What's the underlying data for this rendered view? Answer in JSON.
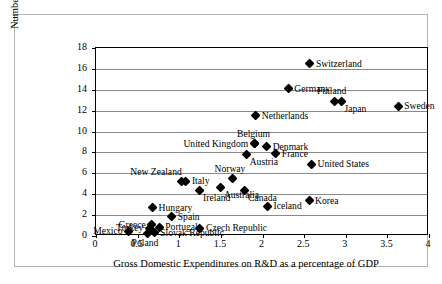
{
  "chart_data": {
    "type": "scatter",
    "title": "",
    "xlabel": "Gross Domestic Expenditures on R&D as a percentage of GDP",
    "ylabel": "Number of triadic patents per million of dollars invested in R&D",
    "xlim": [
      0,
      4
    ],
    "ylim": [
      0,
      18
    ],
    "xticks": [
      "0",
      "0.5",
      "1",
      "1.5",
      "2",
      "2.5",
      "3",
      "3.5",
      "4"
    ],
    "xtick_values": [
      0,
      0.5,
      1,
      1.5,
      2,
      2.5,
      3,
      3.5,
      4
    ],
    "yticks": [
      "0",
      "2",
      "4",
      "6",
      "8",
      "10",
      "12",
      "14",
      "16",
      "18"
    ],
    "ytick_values": [
      0,
      2,
      4,
      6,
      8,
      10,
      12,
      14,
      16,
      18
    ],
    "grid": "horizontal",
    "legend": "none",
    "marker_shape": "diamond",
    "marker_color": "#000000",
    "points": [
      {
        "name": "Switzerland",
        "x": 2.57,
        "y": 16.5,
        "label_pos": "right"
      },
      {
        "name": "Germany",
        "x": 2.31,
        "y": 14.1,
        "label_pos": "right"
      },
      {
        "name": "Finland",
        "x": 2.87,
        "y": 12.9,
        "label_pos": "above"
      },
      {
        "name": "Japan",
        "x": 2.95,
        "y": 12.85,
        "label_pos": "below-right"
      },
      {
        "name": "Sweden",
        "x": 3.63,
        "y": 12.4,
        "label_pos": "right"
      },
      {
        "name": "Netherlands",
        "x": 1.92,
        "y": 11.5,
        "label_pos": "right"
      },
      {
        "name": "Belgium",
        "x": 1.91,
        "y": 8.8,
        "label_pos": "above"
      },
      {
        "name": "United Kingdom",
        "x": 1.9,
        "y": 8.8,
        "label_pos": "left"
      },
      {
        "name": "Denmark",
        "x": 2.05,
        "y": 8.55,
        "label_pos": "right"
      },
      {
        "name": "Austria",
        "x": 1.81,
        "y": 7.75,
        "label_pos": "below-right"
      },
      {
        "name": "France",
        "x": 2.16,
        "y": 7.85,
        "label_pos": "right"
      },
      {
        "name": "United States",
        "x": 2.59,
        "y": 6.85,
        "label_pos": "right"
      },
      {
        "name": "Norway",
        "x": 1.64,
        "y": 5.5,
        "label_pos": "above"
      },
      {
        "name": "New Zealand",
        "x": 1.03,
        "y": 5.2,
        "label_pos": "above-left"
      },
      {
        "name": "Italy",
        "x": 1.08,
        "y": 5.25,
        "label_pos": "right"
      },
      {
        "name": "Australia",
        "x": 1.5,
        "y": 4.6,
        "label_pos": "below-right"
      },
      {
        "name": "Ireland",
        "x": 1.25,
        "y": 4.3,
        "label_pos": "below-right"
      },
      {
        "name": "Canada",
        "x": 1.79,
        "y": 4.3,
        "label_pos": "below-right"
      },
      {
        "name": "Korea",
        "x": 2.56,
        "y": 3.35,
        "label_pos": "right"
      },
      {
        "name": "Iceland",
        "x": 2.06,
        "y": 2.85,
        "label_pos": "right"
      },
      {
        "name": "Hungary",
        "x": 0.68,
        "y": 2.7,
        "label_pos": "right"
      },
      {
        "name": "Spain",
        "x": 0.91,
        "y": 1.85,
        "label_pos": "right"
      },
      {
        "name": "Greece",
        "x": 0.67,
        "y": 1.1,
        "label_pos": "left"
      },
      {
        "name": "Portugal",
        "x": 0.76,
        "y": 0.85,
        "label_pos": "right"
      },
      {
        "name": "Turkey",
        "x": 0.64,
        "y": 0.75,
        "label_pos": "left"
      },
      {
        "name": "Czech Republic",
        "x": 1.25,
        "y": 0.75,
        "label_pos": "right"
      },
      {
        "name": "Slovak Republic",
        "x": 0.7,
        "y": 0.3,
        "label_pos": "right"
      },
      {
        "name": "Poland",
        "x": 0.62,
        "y": 0.25,
        "label_pos": "below"
      },
      {
        "name": "Mexico",
        "x": 0.39,
        "y": 0.45,
        "label_pos": "left"
      }
    ]
  },
  "axis": {
    "x_title": "Gross Domestic Expenditures on R&D as a percentage of GDP",
    "y_title": "Number of triadic patents per million of dollars invested in R&D"
  }
}
